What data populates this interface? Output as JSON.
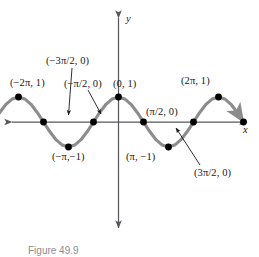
{
  "figure": {
    "caption": "Figure 49.9",
    "axis_labels": {
      "x": "x",
      "y": "y"
    },
    "colors": {
      "curve": "#8c8c8c",
      "axis": "#58585c",
      "point": "#000000",
      "text": "#17171a",
      "background": "#ffffff",
      "caption": "#8d8d93"
    }
  },
  "chart_data": {
    "type": "line",
    "title": "",
    "subtitle": "",
    "xlabel": "x",
    "ylabel": "y",
    "function": "y = cos x",
    "grid": false,
    "legend": null,
    "xlim": [
      -7.853981634,
      7.853981634
    ],
    "ylim": [
      -1.45,
      1.45
    ],
    "x_unit": "pi",
    "series": [
      {
        "name": "y = cos x",
        "x": [
          -7.853981634,
          -7.461282552,
          -7.06858347,
          -6.675884388,
          -6.283185307,
          -5.890486225,
          -5.497787144,
          -5.105088062,
          -4.71238898,
          -4.319689899,
          -3.926990817,
          -3.534291735,
          -3.141592654,
          -2.748893572,
          -2.35619449,
          -1.963495408,
          -1.570796327,
          -1.178097245,
          -0.785398163,
          -0.392699082,
          0,
          0.392699082,
          0.785398163,
          1.178097245,
          1.570796327,
          1.963495408,
          2.35619449,
          2.748893572,
          3.141592654,
          3.534291735,
          3.926990817,
          4.319689899,
          4.71238898,
          5.105088062,
          5.497787144,
          5.890486225,
          6.283185307,
          6.675884388,
          7.06858347,
          7.461282552,
          7.853981634
        ],
        "y": [
          0,
          0.382683432,
          0.707106781,
          0.923879533,
          1,
          0.923879533,
          0.707106781,
          0.382683432,
          0,
          -0.382683432,
          -0.707106781,
          -0.923879533,
          -1,
          -0.923879533,
          -0.707106781,
          -0.382683432,
          0,
          0.382683432,
          0.707106781,
          0.923879533,
          1,
          0.923879533,
          0.707106781,
          0.382683432,
          0,
          -0.382683432,
          -0.707106781,
          -0.923879533,
          -1,
          -0.923879533,
          -0.707106781,
          -0.382683432,
          0,
          0.382683432,
          0.707106781,
          0.923879533,
          1,
          0.923879533,
          0.707106781,
          0.382683432,
          0
        ]
      }
    ],
    "points": [
      {
        "id": "p-n5pi2",
        "x": -7.853981634,
        "y": 0,
        "label": null,
        "labeled": false
      },
      {
        "id": "p-n2pi",
        "x": -6.283185307,
        "y": 1,
        "label": "(−2π, 1)",
        "labeled": true
      },
      {
        "id": "p-n3pi2",
        "x": -4.71238898,
        "y": 0,
        "label": "(−3π/2, 0)",
        "labeled": true
      },
      {
        "id": "p-npi",
        "x": -3.141592654,
        "y": -1,
        "label": "(−π,−1)",
        "labeled": true
      },
      {
        "id": "p-npi2",
        "x": -1.570796327,
        "y": 0,
        "label": "(−π/2, 0)",
        "labeled": true
      },
      {
        "id": "p-zero",
        "x": 0,
        "y": 1,
        "label": "(0, 1)",
        "labeled": true
      },
      {
        "id": "p-pi2",
        "x": 1.570796327,
        "y": 0,
        "label": "(π/2, 0)",
        "labeled": true
      },
      {
        "id": "p-pi",
        "x": 3.141592654,
        "y": -1,
        "label": "(π, −1)",
        "labeled": true
      },
      {
        "id": "p-3pi2",
        "x": 4.71238898,
        "y": 0,
        "label": "(3π/2, 0)",
        "labeled": true
      },
      {
        "id": "p-2pi",
        "x": 6.283185307,
        "y": 1,
        "label": "(2π, 1)",
        "labeled": true
      },
      {
        "id": "p-5pi2",
        "x": 7.853981634,
        "y": 0,
        "label": null,
        "labeled": false
      }
    ],
    "annotations": [
      {
        "id": "a-n2pi1",
        "text": "(−2π, 1)",
        "leader": false
      },
      {
        "id": "a-n3pi2",
        "text": "(−3π/2, 0)",
        "leader": true
      },
      {
        "id": "a-npi2",
        "text": "(−π/2, 0)",
        "leader": true
      },
      {
        "id": "a-0c1",
        "text": "(0, 1)",
        "leader": false
      },
      {
        "id": "a-2pi1",
        "text": "(2π, 1)",
        "leader": false
      },
      {
        "id": "a-pi2",
        "text": "(π/2, 0)",
        "leader": false
      },
      {
        "id": "a-npim1",
        "text": "(−π,−1)",
        "leader": false
      },
      {
        "id": "a-pim1",
        "text": "(π, −1)",
        "leader": false
      },
      {
        "id": "a-3pi2",
        "text": "(3π/2, 0)",
        "leader": true
      }
    ]
  }
}
